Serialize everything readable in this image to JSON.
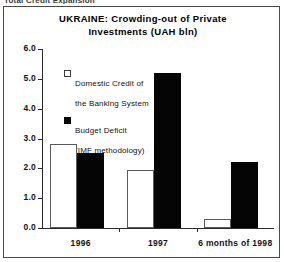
{
  "scan": {
    "top_caption": "Total Credit Expansion"
  },
  "chart_data": {
    "type": "bar",
    "title": "UKRAINE: Crowding-out of Private Investments (UAH bln)",
    "title_line1": "UKRAINE: Crowding-out of Private",
    "title_line2": "Investments (UAH bln)",
    "xlabel": "",
    "ylabel": "",
    "ylim": [
      0.0,
      6.0
    ],
    "ytick_step": 1.0,
    "grid": false,
    "legend_position": "upper-left-inside",
    "categories": [
      "1996",
      "1997",
      "6 months of 1998"
    ],
    "ytick_labels": [
      "0.0",
      "1.0",
      "2.0",
      "3.0",
      "4.0",
      "5.0",
      "6.0"
    ],
    "ytick_values": [
      0.0,
      1.0,
      2.0,
      3.0,
      4.0,
      5.0,
      6.0
    ],
    "series": [
      {
        "name": "Domestic Credit of the Banking System",
        "name_line1": "Domestic Credit of",
        "name_line2": "the Banking System",
        "style": "open",
        "color": "#ffffff",
        "edge_color": "#5a5a5a",
        "values": [
          2.8,
          1.95,
          0.3
        ]
      },
      {
        "name": "Budget Deficit (IMF methodology)",
        "name_line1": "Budget Deficit",
        "name_line2": "(IMF methodology)",
        "style": "filled",
        "color": "#050505",
        "edge_color": "#050505",
        "values": [
          2.5,
          5.2,
          2.2
        ]
      }
    ]
  }
}
